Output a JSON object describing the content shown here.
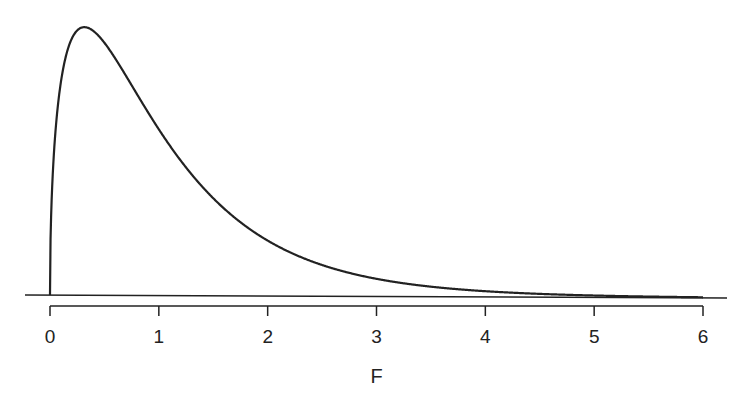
{
  "chart_data": {
    "type": "line",
    "title": "",
    "xlabel": "F",
    "ylabel": "",
    "distribution": "F",
    "df1": 3,
    "df2": 36,
    "xlim": [
      0,
      6
    ],
    "x_ticks": [
      0,
      1,
      2,
      3,
      4,
      5,
      6
    ],
    "tick_labels": [
      "0",
      "1",
      "2",
      "3",
      "4",
      "5",
      "6"
    ],
    "grid": false,
    "legend": null,
    "series": [
      {
        "name": "F density",
        "x": [
          0,
          0.1,
          0.2,
          0.34,
          0.5,
          0.75,
          1,
          1.5,
          2,
          2.5,
          3,
          3.5,
          4,
          5,
          6
        ],
        "relative_height": [
          0,
          0.78,
          0.95,
          1.0,
          0.97,
          0.84,
          0.67,
          0.39,
          0.2,
          0.1,
          0.05,
          0.025,
          0.012,
          0.003,
          0.001
        ]
      }
    ],
    "colors": {
      "curve": "#222222",
      "axis": "#222222"
    }
  }
}
